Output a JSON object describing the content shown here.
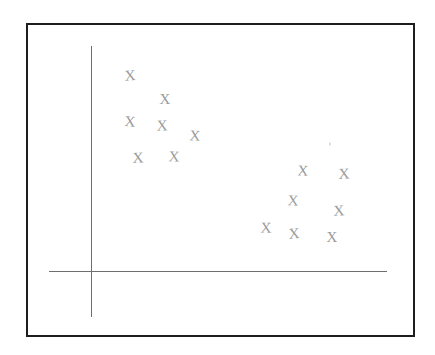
{
  "figure": {
    "caption": "",
    "background_color": "#ffffff",
    "frame_color": "#1d1d1d",
    "axis_color": "#6e6e6e",
    "marker_color": "#9b9b9b",
    "marker_glyph": "X"
  },
  "chart_data": {
    "type": "scatter",
    "title": "",
    "subtitle": "",
    "xlabel": "",
    "ylabel": "",
    "xlim": [
      0,
      389
    ],
    "ylim": [
      0,
      314
    ],
    "grid": false,
    "legend": false,
    "legend_position": "none",
    "axes": {
      "y_axis": {
        "x": 63,
        "y_top": 21,
        "y_bottom": 292
      },
      "x_axis": {
        "y": 246,
        "x_left": 21,
        "x_right": 359
      }
    },
    "annotations": [
      {
        "name": "faint-speck",
        "x": 302,
        "y": 119
      }
    ],
    "series": [
      {
        "name": "Cluster A (upper left)",
        "marker": "X",
        "color": "#9b9b9b",
        "points": [
          {
            "x": 102,
            "y": 51
          },
          {
            "x": 137,
            "y": 74
          },
          {
            "x": 102,
            "y": 97
          },
          {
            "x": 134,
            "y": 101
          },
          {
            "x": 167,
            "y": 111
          },
          {
            "x": 110,
            "y": 133
          },
          {
            "x": 146,
            "y": 132
          }
        ]
      },
      {
        "name": "Cluster B (lower right)",
        "marker": "X",
        "color": "#9b9b9b",
        "points": [
          {
            "x": 275,
            "y": 146
          },
          {
            "x": 316,
            "y": 149
          },
          {
            "x": 265,
            "y": 176
          },
          {
            "x": 311,
            "y": 186
          },
          {
            "x": 238,
            "y": 203
          },
          {
            "x": 266,
            "y": 209
          },
          {
            "x": 304,
            "y": 212
          }
        ]
      }
    ]
  }
}
